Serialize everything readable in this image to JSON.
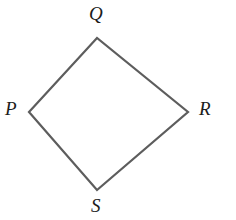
{
  "figure": {
    "name": "quadrilateral-pqrs",
    "background_color": "#ffffff",
    "stroke_color": "#5d5d5d",
    "stroke_width": 2.2,
    "fill_color": "none",
    "label_color": "#1c1c1c",
    "canvas": {
      "width": 236,
      "height": 220
    },
    "vertices": [
      {
        "id": "Q",
        "label": "Q",
        "x": 97,
        "y": 38,
        "label_x": 97,
        "label_y": 13
      },
      {
        "id": "R",
        "label": "R",
        "x": 188,
        "y": 112,
        "label_x": 206,
        "label_y": 108
      },
      {
        "id": "S",
        "label": "S",
        "x": 97,
        "y": 190,
        "label_x": 97,
        "label_y": 205
      },
      {
        "id": "P",
        "label": "P",
        "x": 29,
        "y": 112,
        "label_x": 12,
        "label_y": 108
      }
    ],
    "edges": [
      {
        "from": "P",
        "to": "Q"
      },
      {
        "from": "Q",
        "to": "R"
      },
      {
        "from": "R",
        "to": "S"
      },
      {
        "from": "S",
        "to": "P"
      }
    ],
    "path": "M 29 112 L 97 38 L 188 112 L 97 190 Z"
  }
}
